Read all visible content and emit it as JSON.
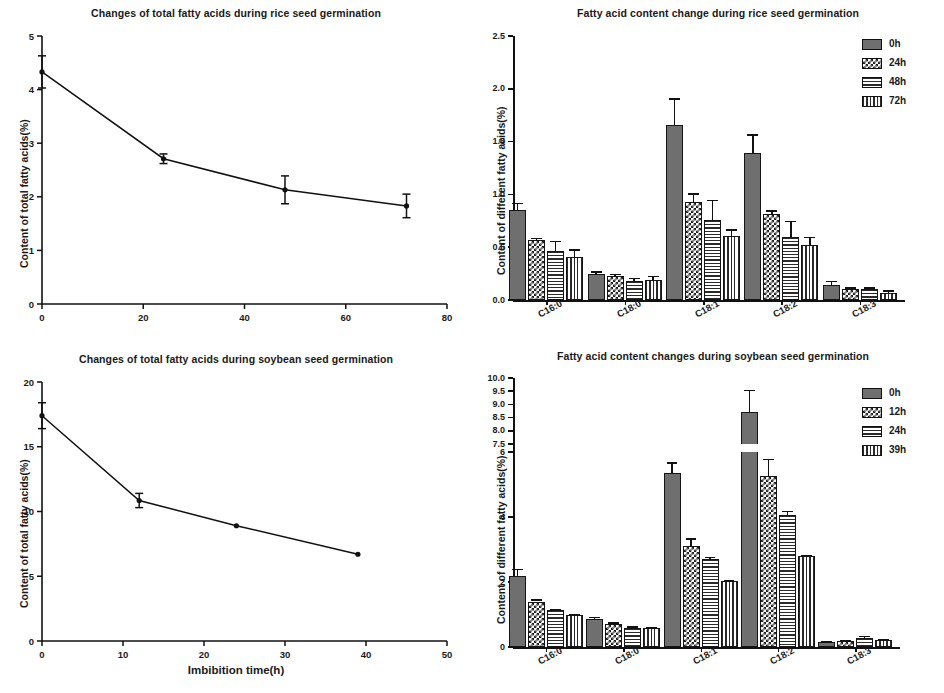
{
  "figure": {
    "kind": "four-panel scientific figure",
    "panels": [
      "rice-total-line",
      "rice-bars",
      "soybean-total-line",
      "soybean-bars"
    ]
  },
  "chart_data": [
    {
      "id": "rice-total-line",
      "type": "line",
      "title": "Changes of total fatty acids during rice seed germination",
      "xlabel": "",
      "ylabel": "Content of total fatty acids(%)",
      "xlim": [
        0,
        80
      ],
      "ylim": [
        0,
        5
      ],
      "xticks": [
        "0",
        "20",
        "40",
        "60",
        "80"
      ],
      "yticks": [
        "0",
        "1",
        "2",
        "3",
        "4",
        "5"
      ],
      "grid": false,
      "legend": "none",
      "x": [
        0,
        24,
        48,
        72
      ],
      "values": [
        4.33,
        2.71,
        2.13,
        1.83
      ],
      "errors": [
        0.3,
        0.09,
        0.26,
        0.22
      ]
    },
    {
      "id": "rice-bars",
      "type": "bar",
      "title": "Fatty acid content change during rice seed germination",
      "xlabel": "",
      "ylabel": "Content of different fatty acids(%)",
      "categories": [
        "C16:0",
        "C18:0",
        "C18:1",
        "C18:2",
        "C18:3"
      ],
      "ylim": [
        0,
        2.5
      ],
      "yticks": [
        "0.0",
        "0.5",
        "1.0",
        "1.5",
        "2.0",
        "2.5"
      ],
      "grid": false,
      "legend_position": "top-right",
      "series": [
        {
          "name": "0h",
          "pattern": "solid",
          "values": [
            0.85,
            0.25,
            1.66,
            1.39,
            0.14
          ],
          "errors": [
            0.07,
            0.02,
            0.25,
            0.18,
            0.04
          ]
        },
        {
          "name": "24h",
          "pattern": "check",
          "values": [
            0.57,
            0.23,
            0.93,
            0.81,
            0.1
          ],
          "errors": [
            0.02,
            0.02,
            0.08,
            0.04,
            0.02
          ]
        },
        {
          "name": "48h",
          "pattern": "horz",
          "values": [
            0.46,
            0.18,
            0.76,
            0.6,
            0.1
          ],
          "errors": [
            0.1,
            0.03,
            0.19,
            0.15,
            0.02
          ]
        },
        {
          "name": "72h",
          "pattern": "vert",
          "values": [
            0.41,
            0.19,
            0.61,
            0.52,
            0.07
          ],
          "errors": [
            0.07,
            0.04,
            0.06,
            0.08,
            0.02
          ]
        }
      ]
    },
    {
      "id": "soybean-total-line",
      "type": "line",
      "title": "Changes of total fatty acids during soybean seed germination",
      "xlabel": "Imbibition  time(h)",
      "ylabel": "Content of total fatty acids(%)",
      "xlim": [
        0,
        50
      ],
      "ylim": [
        0,
        20
      ],
      "xticks": [
        "0",
        "10",
        "20",
        "30",
        "40",
        "50"
      ],
      "yticks": [
        "0",
        "5",
        "10",
        "15",
        "20"
      ],
      "grid": false,
      "legend": "none",
      "x": [
        0,
        12,
        24,
        39
      ],
      "values": [
        17.4,
        10.85,
        8.9,
        6.7
      ],
      "errors": [
        1.0,
        0.55,
        0.0,
        0.0
      ]
    },
    {
      "id": "soybean-bars",
      "type": "bar",
      "title": "Fatty acid content changes during soybean seed germination",
      "xlabel": "",
      "ylabel": "Content of different fatty acids(%)",
      "categories": [
        "C16:0",
        "C18:0",
        "C18:1",
        "C18:2",
        "C18:3"
      ],
      "broken_axis": true,
      "ylim_lower": [
        0,
        6
      ],
      "ylim_upper": [
        7.5,
        10.0
      ],
      "yticks_lower": [
        "0",
        "2",
        "4",
        "6"
      ],
      "yticks_upper": [
        "7.5",
        "8.0",
        "8.5",
        "9.0",
        "9.5",
        "10.0"
      ],
      "grid": false,
      "legend_position": "top-right",
      "series": [
        {
          "name": "0h",
          "pattern": "solid",
          "values": [
            2.18,
            0.86,
            5.35,
            8.7,
            0.14
          ],
          "errors": [
            0.22,
            0.07,
            0.33,
            0.85,
            0.03
          ]
        },
        {
          "name": "12h",
          "pattern": "check",
          "values": [
            1.4,
            0.7,
            3.1,
            5.25,
            0.17
          ],
          "errors": [
            0.07,
            0.06,
            0.24,
            0.55,
            0.04
          ]
        },
        {
          "name": "24h",
          "pattern": "horz",
          "values": [
            1.13,
            0.57,
            2.7,
            4.05,
            0.28
          ],
          "errors": [
            0.05,
            0.07,
            0.07,
            0.15,
            0.06
          ]
        },
        {
          "name": "39h",
          "pattern": "vert",
          "values": [
            1.0,
            0.58,
            2.02,
            2.8,
            0.22
          ],
          "errors": [
            0.03,
            0.03,
            0.04,
            0.03,
            0.03
          ]
        }
      ]
    }
  ]
}
